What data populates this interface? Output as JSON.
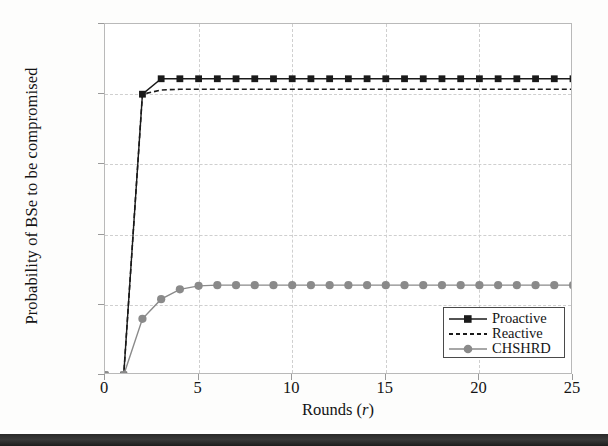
{
  "chart_data": {
    "type": "line",
    "title": "",
    "xlabel": "Rounds (r)",
    "ylabel": "Probability of BSe to be compromised",
    "xlim": [
      0,
      25
    ],
    "ylim": [
      0,
      0.25
    ],
    "xticks": [
      0,
      5,
      10,
      15,
      20,
      25
    ],
    "yticks": [
      0,
      0.05,
      0.1,
      0.15,
      0.2,
      0.25
    ],
    "xtick_labels": [
      "0",
      "5",
      "10",
      "15",
      "20",
      "25"
    ],
    "ytick_labels": [
      "0",
      "0.05",
      "0.1",
      "0.15",
      "0.2",
      "0.25"
    ],
    "grid": true,
    "legend_position": "lower right",
    "x": [
      0,
      1,
      2,
      3,
      4,
      5,
      6,
      7,
      8,
      9,
      10,
      11,
      12,
      13,
      14,
      15,
      16,
      17,
      18,
      19,
      20,
      21,
      22,
      23,
      24,
      25
    ],
    "series": [
      {
        "name": "Proactive",
        "color": "#1a1a1a",
        "style": "solid",
        "marker": "square",
        "values": [
          0,
          0,
          0.2,
          0.211,
          0.211,
          0.211,
          0.211,
          0.211,
          0.211,
          0.211,
          0.211,
          0.211,
          0.211,
          0.211,
          0.211,
          0.211,
          0.211,
          0.211,
          0.211,
          0.211,
          0.211,
          0.211,
          0.211,
          0.211,
          0.211,
          0.211
        ]
      },
      {
        "name": "Reactive",
        "color": "#1a1a1a",
        "style": "dashed",
        "marker": "none",
        "values": [
          0,
          0,
          0.2,
          0.203,
          0.2035,
          0.2035,
          0.2035,
          0.2035,
          0.2035,
          0.2035,
          0.2035,
          0.2035,
          0.2035,
          0.2035,
          0.2035,
          0.2035,
          0.2035,
          0.2035,
          0.2035,
          0.2035,
          0.2035,
          0.2035,
          0.2035,
          0.2035,
          0.2035,
          0.2035
        ]
      },
      {
        "name": "CHSHRD",
        "color": "#8a8a8a",
        "style": "solid",
        "marker": "circle",
        "values": [
          0,
          0,
          0.04,
          0.054,
          0.061,
          0.0635,
          0.064,
          0.064,
          0.064,
          0.064,
          0.064,
          0.064,
          0.064,
          0.064,
          0.064,
          0.064,
          0.064,
          0.064,
          0.064,
          0.064,
          0.064,
          0.064,
          0.064,
          0.064,
          0.064,
          0.064
        ]
      }
    ]
  },
  "legend": {
    "items": [
      {
        "label": "Proactive"
      },
      {
        "label": "Reactive"
      },
      {
        "label": "CHSHRD"
      }
    ]
  },
  "axes": {
    "xlabel_main": "Rounds (",
    "xlabel_var": "r",
    "xlabel_close": ")"
  }
}
